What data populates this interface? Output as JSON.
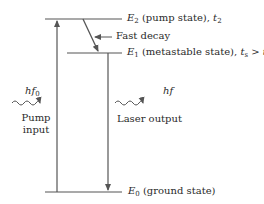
{
  "levels": {
    "e2": {
      "symbol": "E",
      "sub": "2",
      "desc": "(pump state),",
      "time_symbol": "t",
      "time_sub": "2"
    },
    "e1": {
      "symbol": "E",
      "sub": "1",
      "desc": "(metastable state),",
      "time_symbol": "t",
      "time_sub": "s",
      "relation": ">",
      "time2_symbol": "t",
      "time2_sub": "2"
    },
    "e0": {
      "symbol": "E",
      "sub": "0",
      "desc": "(ground state)"
    }
  },
  "transitions": {
    "fast_decay": "Fast decay",
    "pump_photon": {
      "symbol": "hf",
      "sub": "0"
    },
    "pump_label_line1": "Pump",
    "pump_label_line2": "input",
    "laser_photon": {
      "symbol": "hf"
    },
    "laser_label": "Laser output"
  },
  "colors": {
    "line": "#555555",
    "text": "#2a2a2a"
  }
}
